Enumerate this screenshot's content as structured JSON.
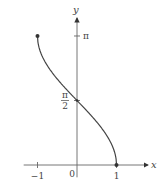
{
  "chart_data": {
    "type": "line",
    "title": "",
    "function": "y = arccos(x)",
    "xlabel": "x",
    "ylabel": "y",
    "xlim": [
      -1.35,
      1.85
    ],
    "ylim": [
      -0.3,
      3.75
    ],
    "x_ticks": [
      {
        "value": -1,
        "label": "−1"
      },
      {
        "value": 1,
        "label": "1"
      }
    ],
    "origin_label": "0",
    "y_ticks": [
      {
        "value": 1.5708,
        "label_num": "π",
        "label_den": "2"
      },
      {
        "value": 3.1416,
        "label": "π"
      }
    ],
    "series": [
      {
        "name": "arccos",
        "domain": [
          -1,
          1
        ],
        "endpoints": [
          [
            -1,
            3.1416
          ],
          [
            1,
            0
          ]
        ]
      }
    ],
    "marked_points": [
      [
        -1,
        3.1416
      ],
      [
        0,
        1.5708
      ],
      [
        1,
        0
      ]
    ],
    "grid": false,
    "legend": "none",
    "colors": {
      "axis": "#666666",
      "curve": "#444444",
      "text": "#444444"
    }
  }
}
